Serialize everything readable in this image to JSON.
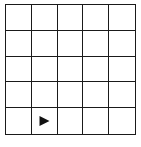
{
  "grid": {
    "rows": 5,
    "cols": 5,
    "line_color": "#1a1a1a",
    "background": "#ffffff"
  },
  "agent": {
    "icon": "triangle-right-icon",
    "direction": "right",
    "row": 4,
    "col": 1,
    "color": "#111111"
  }
}
